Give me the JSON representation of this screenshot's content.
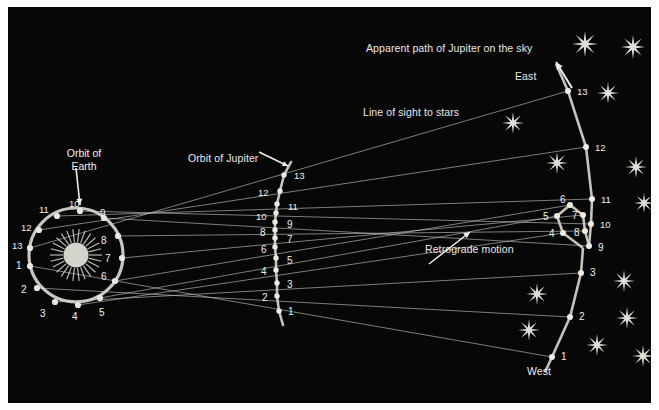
{
  "figure": {
    "background_color": "#070707",
    "frame_color": "#ffffff",
    "line_color": "#c9c8c0",
    "orbit_color": "#d8d7cf",
    "text_color": "#f0efec",
    "sun_color": "#cfcec6",
    "width": 659,
    "height": 410
  },
  "labels": {
    "orbit_of_earth": "Orbit of\nEarth",
    "orbit_of_earth_line1": "Orbit of",
    "orbit_of_earth_line2": "Earth",
    "orbit_of_jupiter": "Orbit of Jupiter",
    "apparent_path": "Apparent path of Jupiter on the sky",
    "line_of_sight": "Line of sight to stars",
    "retrograde_motion": "Retrograde motion",
    "east": "East",
    "west": "West"
  },
  "earth_orbit": {
    "name": "Orbit of Earth",
    "center": [
      76,
      255
    ],
    "radius": 47,
    "positions": [
      {
        "n": "1",
        "x": 30,
        "y": 266,
        "lx": 16,
        "ly": 261
      },
      {
        "n": "2",
        "x": 37,
        "y": 288,
        "lx": 21,
        "ly": 285
      },
      {
        "n": "3",
        "x": 55,
        "y": 302,
        "lx": 40,
        "ly": 309
      },
      {
        "n": "4",
        "x": 78,
        "y": 305,
        "lx": 72,
        "ly": 312
      },
      {
        "n": "5",
        "x": 100,
        "y": 298,
        "lx": 99,
        "ly": 308
      },
      {
        "n": "6",
        "x": 115,
        "y": 281,
        "lx": 101,
        "ly": 272
      },
      {
        "n": "7",
        "x": 122,
        "y": 258,
        "lx": 105,
        "ly": 254
      },
      {
        "n": "8",
        "x": 118,
        "y": 236,
        "lx": 101,
        "ly": 236
      },
      {
        "n": "9",
        "x": 104,
        "y": 218,
        "lx": 100,
        "ly": 209
      },
      {
        "n": "10",
        "x": 80,
        "y": 211,
        "lx": 69,
        "ly": 199
      },
      {
        "n": "11",
        "x": 57,
        "y": 216,
        "lx": 39,
        "ly": 205
      },
      {
        "n": "12",
        "x": 39,
        "y": 230,
        "lx": 21,
        "ly": 223
      },
      {
        "n": "13",
        "x": 30,
        "y": 248,
        "lx": 12,
        "ly": 241
      }
    ]
  },
  "jupiter_orbit": {
    "name": "Orbit of Jupiter",
    "positions": [
      {
        "n": "1",
        "x": 279,
        "y": 311,
        "lx": 288,
        "ly": 307
      },
      {
        "n": "2",
        "x": 277,
        "y": 296,
        "lx": 262,
        "ly": 293
      },
      {
        "n": "3",
        "x": 277,
        "y": 283,
        "lx": 287,
        "ly": 280
      },
      {
        "n": "4",
        "x": 276,
        "y": 270,
        "lx": 261,
        "ly": 267
      },
      {
        "n": "5",
        "x": 276,
        "y": 258,
        "lx": 287,
        "ly": 256
      },
      {
        "n": "6",
        "x": 275,
        "y": 247,
        "lx": 261,
        "ly": 245
      },
      {
        "n": "7",
        "x": 275,
        "y": 238,
        "lx": 287,
        "ly": 235
      },
      {
        "n": "8",
        "x": 275,
        "y": 230,
        "lx": 260,
        "ly": 228
      },
      {
        "n": "9",
        "x": 275,
        "y": 222,
        "lx": 287,
        "ly": 220
      },
      {
        "n": "10",
        "x": 276,
        "y": 213,
        "lx": 256,
        "ly": 212
      },
      {
        "n": "11",
        "x": 277,
        "y": 204,
        "lx": 288,
        "ly": 202
      },
      {
        "n": "12",
        "x": 280,
        "y": 191,
        "lx": 258,
        "ly": 188
      },
      {
        "n": "13",
        "x": 284,
        "y": 175,
        "lx": 294,
        "ly": 171
      }
    ]
  },
  "apparent_path": {
    "name": "Apparent path of Jupiter on the sky",
    "direction_east": "East",
    "direction_west": "West",
    "positions": [
      {
        "n": "1",
        "x": 552,
        "y": 357,
        "lx": 561,
        "ly": 352
      },
      {
        "n": "2",
        "x": 570,
        "y": 317,
        "lx": 579,
        "ly": 312
      },
      {
        "n": "3",
        "x": 581,
        "y": 273,
        "lx": 590,
        "ly": 268
      },
      {
        "n": "4",
        "x": 563,
        "y": 233,
        "lx": 549,
        "ly": 229
      },
      {
        "n": "5",
        "x": 557,
        "y": 216,
        "lx": 543,
        "ly": 212
      },
      {
        "n": "6",
        "x": 570,
        "y": 205,
        "lx": 560,
        "ly": 195
      },
      {
        "n": "7",
        "x": 583,
        "y": 215,
        "lx": 572,
        "ly": 211
      },
      {
        "n": "8",
        "x": 585,
        "y": 231,
        "lx": 574,
        "ly": 228
      },
      {
        "n": "9",
        "x": 589,
        "y": 246,
        "lx": 598,
        "ly": 243
      },
      {
        "n": "10",
        "x": 591,
        "y": 224,
        "lx": 600,
        "ly": 220
      },
      {
        "n": "11",
        "x": 592,
        "y": 199,
        "lx": 601,
        "ly": 195
      },
      {
        "n": "12",
        "x": 586,
        "y": 147,
        "lx": 595,
        "ly": 143
      },
      {
        "n": "13",
        "x": 568,
        "y": 91,
        "lx": 577,
        "ly": 87
      }
    ]
  },
  "stars": [
    {
      "x": 585,
      "y": 44,
      "r": 13
    },
    {
      "x": 633,
      "y": 47,
      "r": 12
    },
    {
      "x": 608,
      "y": 93,
      "r": 11
    },
    {
      "x": 513,
      "y": 123,
      "r": 11
    },
    {
      "x": 557,
      "y": 163,
      "r": 11
    },
    {
      "x": 636,
      "y": 167,
      "r": 11
    },
    {
      "x": 644,
      "y": 203,
      "r": 10
    },
    {
      "x": 624,
      "y": 281,
      "r": 11
    },
    {
      "x": 537,
      "y": 294,
      "r": 11
    },
    {
      "x": 627,
      "y": 318,
      "r": 11
    },
    {
      "x": 529,
      "y": 330,
      "r": 11
    },
    {
      "x": 597,
      "y": 345,
      "r": 11
    },
    {
      "x": 643,
      "y": 356,
      "r": 11
    }
  ],
  "annotations": {
    "earth_arrow": {
      "label": "Orbit of Earth",
      "from": [
        76,
        168
      ],
      "to": [
        80,
        205
      ]
    },
    "jupiter_arrow": {
      "label": "Orbit of Jupiter",
      "to": [
        288,
        166
      ]
    },
    "retrograde_arrow": {
      "label": "Retrograde motion",
      "from": [
        429,
        264
      ],
      "to": [
        470,
        232
      ]
    },
    "east_arrow": {
      "to": [
        556,
        62
      ]
    }
  }
}
